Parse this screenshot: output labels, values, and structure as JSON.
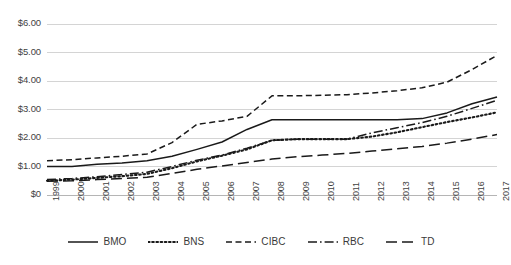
{
  "chart_data": {
    "type": "line",
    "title": "",
    "subtitle": "",
    "xlabel": "",
    "ylabel": "",
    "grid": true,
    "legend_position": "bottom",
    "x": [
      1999,
      2000,
      2001,
      2002,
      2003,
      2004,
      2005,
      2006,
      2007,
      2008,
      2009,
      2010,
      2011,
      2012,
      2013,
      2014,
      2015,
      2016,
      2017
    ],
    "categories": [
      "1999",
      "2000",
      "2001",
      "2002",
      "2003",
      "2004",
      "2005",
      "2006",
      "2007",
      "2008",
      "2009",
      "2010",
      "2011",
      "2012",
      "2013",
      "2014",
      "2015",
      "2016",
      "2017"
    ],
    "ylim": [
      0,
      6
    ],
    "xlim": [
      1999,
      2017
    ],
    "ytick_labels": [
      "$6.00",
      "$5.00",
      "$4.00",
      "$3.00",
      "$2.00",
      "$1.00",
      "$0"
    ],
    "ytick_values": [
      6,
      5,
      4,
      3,
      2,
      1,
      0
    ],
    "series": [
      {
        "name": "BMO",
        "style": "solid",
        "color": "#1a1a1a",
        "values": [
          1.0,
          1.0,
          1.08,
          1.12,
          1.2,
          1.36,
          1.6,
          1.86,
          2.3,
          2.64,
          2.64,
          2.64,
          2.64,
          2.64,
          2.64,
          2.68,
          2.88,
          3.2,
          3.44
        ]
      },
      {
        "name": "BNS",
        "style": "dotted",
        "color": "#1a1a1a",
        "values": [
          0.5,
          0.54,
          0.6,
          0.66,
          0.74,
          0.94,
          1.18,
          1.38,
          1.6,
          1.92,
          1.96,
          1.96,
          1.96,
          2.05,
          2.2,
          2.38,
          2.56,
          2.72,
          2.9
        ]
      },
      {
        "name": "CIBC",
        "style": "dashed",
        "color": "#1a1a1a",
        "values": [
          1.2,
          1.24,
          1.3,
          1.36,
          1.44,
          1.84,
          2.48,
          2.6,
          2.76,
          3.48,
          3.48,
          3.5,
          3.52,
          3.58,
          3.66,
          3.76,
          3.96,
          4.4,
          4.9
        ]
      },
      {
        "name": "RBC",
        "style": "dashdot",
        "color": "#1a1a1a",
        "values": [
          0.54,
          0.58,
          0.64,
          0.72,
          0.8,
          1.0,
          1.22,
          1.4,
          1.64,
          1.92,
          1.96,
          1.96,
          1.96,
          2.18,
          2.36,
          2.54,
          2.76,
          3.04,
          3.32
        ]
      },
      {
        "name": "TD",
        "style": "longdash",
        "color": "#1a1a1a",
        "values": [
          0.48,
          0.5,
          0.54,
          0.58,
          0.62,
          0.76,
          0.9,
          1.02,
          1.14,
          1.26,
          1.34,
          1.4,
          1.46,
          1.54,
          1.62,
          1.7,
          1.82,
          1.96,
          2.12
        ]
      }
    ]
  },
  "legend": {
    "items": [
      {
        "label": "BMO",
        "style": "solid"
      },
      {
        "label": "BNS",
        "style": "dotted"
      },
      {
        "label": "CIBC",
        "style": "dashed"
      },
      {
        "label": "RBC",
        "style": "dashdot"
      },
      {
        "label": "TD",
        "style": "longdash"
      }
    ]
  },
  "axes": {
    "gridline_color": "#d4d4d4",
    "axis_color": "#b5b5b5",
    "tick_color": "#3f3f3f"
  }
}
